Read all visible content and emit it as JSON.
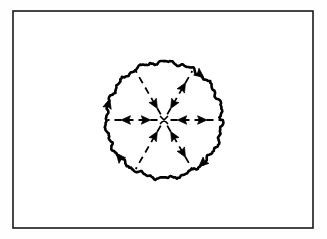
{
  "figure": {
    "background_color": "#fefefe",
    "ink_color": "#000000",
    "frame": {
      "name": "figure-border",
      "x": 13,
      "y": 11,
      "width": 300,
      "height": 217,
      "stroke_width": 1.6,
      "stroke_color": "#1a1a1a",
      "fill": "#ffffff"
    },
    "circle": {
      "name": "wobbly-circle",
      "center_x": 164,
      "center_y": 120,
      "radius": 58,
      "stroke_width": 2.6,
      "stroke_color": "#000000",
      "style": "hand-drawn-wobbly",
      "wobble_amplitude": 1.6,
      "wobble_periods": 34,
      "circulation": "clockwise"
    },
    "boundary_arrows": [
      {
        "name": "boundary-arrow-upper-right",
        "angle_deg": -52,
        "direction": "clockwise"
      },
      {
        "name": "boundary-arrow-lower-right",
        "angle_deg": 48,
        "direction": "clockwise"
      },
      {
        "name": "boundary-arrow-bottom-left",
        "angle_deg": 140,
        "direction": "clockwise"
      },
      {
        "name": "boundary-arrow-left",
        "angle_deg": 196,
        "direction": "clockwise"
      }
    ],
    "spokes": [
      {
        "name": "spoke-east",
        "angle_deg": 0,
        "style": "dashed",
        "inner_arrow": "inward",
        "outer_arrow": "outward"
      },
      {
        "name": "spoke-northeast",
        "angle_deg": -60,
        "style": "dashed",
        "inner_arrow": "inward",
        "outer_arrow": "outward"
      },
      {
        "name": "spoke-northwest",
        "angle_deg": -120,
        "style": "dashed",
        "inner_arrow": "inward",
        "outer_arrow": "none"
      },
      {
        "name": "spoke-west",
        "angle_deg": 180,
        "style": "dashed",
        "inner_arrow": "inward",
        "outer_arrow": "outward"
      },
      {
        "name": "spoke-southwest",
        "angle_deg": 120,
        "style": "dashed",
        "inner_arrow": "inward",
        "outer_arrow": "none"
      },
      {
        "name": "spoke-southeast",
        "angle_deg": 60,
        "style": "dashed",
        "inner_arrow": "inward",
        "outer_arrow": "outward"
      }
    ],
    "spoke_dash_pattern": "7 5",
    "spoke_stroke_width": 1.8,
    "center_marker": {
      "name": "center-convergence-point",
      "x": 164,
      "y": 120,
      "label": ""
    },
    "labels": []
  }
}
